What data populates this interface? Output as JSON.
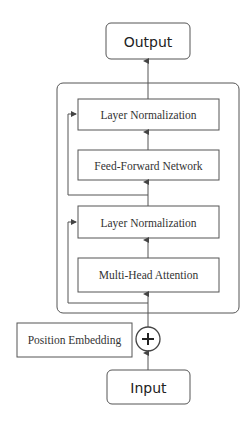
{
  "diagram": {
    "nodes": {
      "output": {
        "label": "Output"
      },
      "layer_norm_top": {
        "label": "Layer Normalization"
      },
      "feed_forward": {
        "label": "Feed-Forward Network"
      },
      "layer_norm_bottom": {
        "label": "Layer Normalization"
      },
      "multi_head_attention": {
        "label": "Multi-Head Attention"
      },
      "position_embedding": {
        "label": "Position Embedding"
      },
      "add": {
        "symbol": "+"
      },
      "input": {
        "label": "Input"
      }
    },
    "edges": [
      {
        "from": "input",
        "to": "add"
      },
      {
        "from": "position_embedding",
        "to": "add"
      },
      {
        "from": "add",
        "to": "multi_head_attention"
      },
      {
        "from": "add",
        "to": "layer_norm_bottom",
        "type": "residual"
      },
      {
        "from": "multi_head_attention",
        "to": "layer_norm_bottom"
      },
      {
        "from": "layer_norm_bottom",
        "to": "feed_forward"
      },
      {
        "from": "layer_norm_bottom",
        "to": "layer_norm_top",
        "type": "residual"
      },
      {
        "from": "feed_forward",
        "to": "layer_norm_top"
      },
      {
        "from": "layer_norm_top",
        "to": "output"
      }
    ],
    "colors": {
      "stroke": "#555555",
      "text": "#333333",
      "background": "#ffffff"
    }
  }
}
